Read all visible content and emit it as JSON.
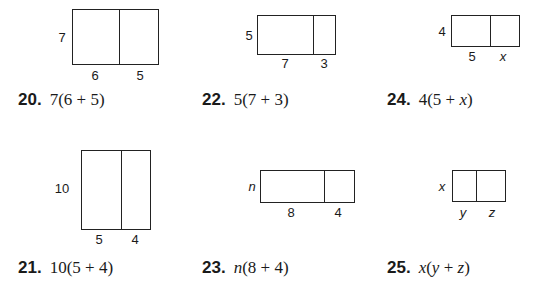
{
  "problems": [
    {
      "number": "20.",
      "expression": "7(6 + 5)",
      "side": "7",
      "parts": [
        "6",
        "5"
      ],
      "rect": {
        "left": 72,
        "top": 9,
        "width": 87,
        "height": 56,
        "divider": 46
      },
      "side_pos": [
        62,
        37
      ],
      "part_pos": [
        [
          95,
          75
        ],
        [
          140,
          75
        ]
      ],
      "label_pos": [
        18,
        90
      ],
      "italic": false
    },
    {
      "number": "22.",
      "expression": "5(7 + 3)",
      "side": "5",
      "parts": [
        "7",
        "3"
      ],
      "rect": {
        "left": 257,
        "top": 15,
        "width": 79,
        "height": 40,
        "divider": 55
      },
      "side_pos": [
        249,
        35
      ],
      "part_pos": [
        [
          285,
          63
        ],
        [
          324,
          63
        ]
      ],
      "label_pos": [
        202,
        90
      ],
      "italic": false
    },
    {
      "number": "24.",
      "expression": "4(5 + x)",
      "side": "4",
      "parts": [
        "5",
        "x"
      ],
      "rect": {
        "left": 451,
        "top": 15,
        "width": 69,
        "height": 32,
        "divider": 38
      },
      "side_pos": [
        442,
        31
      ],
      "part_pos": [
        [
          472,
          56
        ],
        [
          503,
          56
        ]
      ],
      "label_pos": [
        387,
        90
      ],
      "italic": false
    },
    {
      "number": "21.",
      "expression": "10(5 + 4)",
      "side": "10",
      "parts": [
        "5",
        "4"
      ],
      "rect": {
        "left": 81,
        "top": 150,
        "width": 70,
        "height": 80,
        "divider": 39
      },
      "side_pos": [
        62,
        188
      ],
      "part_pos": [
        [
          99,
          239
        ],
        [
          135,
          239
        ]
      ],
      "label_pos": [
        18,
        258
      ],
      "italic": false
    },
    {
      "number": "23.",
      "expression": "n(8 + 4)",
      "side": "n",
      "parts": [
        "8",
        "4"
      ],
      "rect": {
        "left": 260,
        "top": 170,
        "width": 95,
        "height": 33,
        "divider": 63
      },
      "side_pos": [
        252,
        186
      ],
      "part_pos": [
        [
          291,
          212
        ],
        [
          338,
          212
        ]
      ],
      "label_pos": [
        202,
        258
      ],
      "italic": true
    },
    {
      "number": "25.",
      "expression": "x(y + z)",
      "side": "x",
      "parts": [
        "y",
        "z"
      ],
      "rect": {
        "left": 452,
        "top": 170,
        "width": 54,
        "height": 32,
        "divider": 23
      },
      "side_pos": [
        442,
        186
      ],
      "part_pos": [
        [
          463,
          212
        ],
        [
          492,
          212
        ]
      ],
      "label_pos": [
        387,
        258
      ],
      "italic": true
    }
  ],
  "expr_html": {
    "24": [
      "4(5 + ",
      "x",
      ")"
    ],
    "23": [
      "",
      "n",
      "(8 + 4)"
    ],
    "25": [
      "x(y + z)"
    ]
  }
}
